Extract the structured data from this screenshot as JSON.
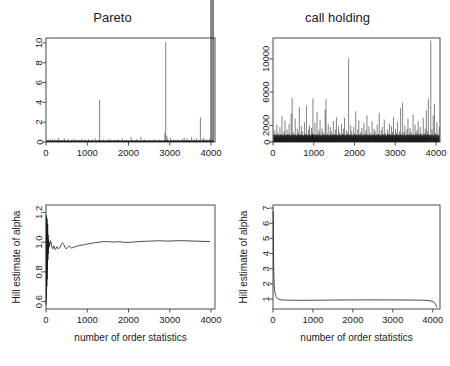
{
  "figure": {
    "layout": "2x2 grid of R base-graphics panels",
    "background": "#ffffff",
    "line_color": "#1a1a1a",
    "frame_color": "#4a4a4a"
  },
  "chart_data": [
    {
      "id": "pareto-spikes",
      "type": "bar",
      "title": "Pareto",
      "xlabel": "",
      "ylabel": "",
      "xlim": [
        0,
        4096
      ],
      "ylim": [
        0,
        10.5
      ],
      "xticks": [
        0,
        1000,
        2000,
        3000,
        4000
      ],
      "yticks": [
        0,
        2,
        4,
        6,
        8,
        10
      ],
      "xticklabels": [
        "0",
        "1000",
        "2000",
        "3000",
        "4000"
      ],
      "yticklabels": [
        "0",
        "2",
        "4",
        "6",
        "8",
        "10"
      ],
      "grid": false,
      "legend": null,
      "description": "Simulated i.i.d. Pareto(alpha=1) sample plotted as vertical spikes against index; a few extreme outliers dominate.",
      "notable_spikes": [
        {
          "x": 1300,
          "y": 4.25
        },
        {
          "x": 2990,
          "y": 10.1
        },
        {
          "x": 3830,
          "y": 2.5
        },
        {
          "x": 2960,
          "y": 0.95
        },
        {
          "x": 3020,
          "y": 0.62
        }
      ],
      "x": [
        15,
        32,
        48,
        70,
        95,
        118,
        140,
        165,
        188,
        210,
        232,
        258,
        280,
        305,
        328,
        350,
        372,
        398,
        420,
        445,
        468,
        490,
        512,
        538,
        560,
        585,
        608,
        630,
        652,
        678,
        700,
        722,
        748,
        770,
        795,
        818,
        840,
        862,
        888,
        910,
        932,
        958,
        980,
        1002,
        1028,
        1050,
        1072,
        1098,
        1120,
        1142,
        1168,
        1190,
        1212,
        1238,
        1260,
        1282,
        1300,
        1318,
        1340,
        1362,
        1388,
        1410,
        1432,
        1458,
        1480,
        1502,
        1528,
        1550,
        1572,
        1598,
        1620,
        1642,
        1668,
        1690,
        1712,
        1738,
        1760,
        1782,
        1808,
        1830,
        1852,
        1878,
        1900,
        1922,
        1948,
        1970,
        1992,
        2018,
        2040,
        2062,
        2088,
        2110,
        2132,
        2158,
        2180,
        2202,
        2228,
        2250,
        2272,
        2298,
        2320,
        2342,
        2368,
        2390,
        2412,
        2438,
        2460,
        2482,
        2508,
        2530,
        2552,
        2578,
        2600,
        2622,
        2648,
        2670,
        2692,
        2718,
        2740,
        2762,
        2788,
        2810,
        2832,
        2858,
        2880,
        2902,
        2928,
        2950,
        2960,
        2990,
        3020,
        3042,
        3068,
        3090,
        3112,
        3138,
        3160,
        3182,
        3208,
        3230,
        3252,
        3278,
        3300,
        3322,
        3348,
        3370,
        3392,
        3418,
        3440,
        3462,
        3488,
        3510,
        3532,
        3558,
        3580,
        3602,
        3628,
        3650,
        3672,
        3698,
        3720,
        3742,
        3768,
        3790,
        3812,
        3830,
        3850,
        3872,
        3898,
        3920,
        3942,
        3968,
        3990,
        4012,
        4038,
        4060
      ],
      "values": [
        0.12,
        0.05,
        0.22,
        0.08,
        0.14,
        0.31,
        0.06,
        0.18,
        0.09,
        0.27,
        0.11,
        0.07,
        0.19,
        0.42,
        0.09,
        0.15,
        0.06,
        0.23,
        0.1,
        0.35,
        0.08,
        0.17,
        0.05,
        0.29,
        0.12,
        0.07,
        0.21,
        0.09,
        0.16,
        0.33,
        0.06,
        0.14,
        0.25,
        0.08,
        0.11,
        0.19,
        0.07,
        0.3,
        0.09,
        0.13,
        0.22,
        0.06,
        0.18,
        0.1,
        0.28,
        0.08,
        0.15,
        0.05,
        0.24,
        0.12,
        0.09,
        0.37,
        0.07,
        0.16,
        0.11,
        0.2,
        4.25,
        0.08,
        0.14,
        0.06,
        0.26,
        0.1,
        0.18,
        0.07,
        0.13,
        0.23,
        0.09,
        0.31,
        0.05,
        0.17,
        0.12,
        0.08,
        0.21,
        0.06,
        0.15,
        0.28,
        0.1,
        0.19,
        0.07,
        0.13,
        0.35,
        0.09,
        0.16,
        0.06,
        0.24,
        0.11,
        0.08,
        0.18,
        0.05,
        0.47,
        0.13,
        0.09,
        0.22,
        0.07,
        0.16,
        0.3,
        0.1,
        0.14,
        0.06,
        0.52,
        0.11,
        0.08,
        0.19,
        0.25,
        0.07,
        0.13,
        0.09,
        0.17,
        0.06,
        0.21,
        0.12,
        0.08,
        0.15,
        0.28,
        0.1,
        0.06,
        0.18,
        0.11,
        0.23,
        0.07,
        0.14,
        0.09,
        0.19,
        0.12,
        0.95,
        10.1,
        0.62,
        0.33,
        0.18,
        0.09,
        0.41,
        0.14,
        0.07,
        0.22,
        0.11,
        0.16,
        0.08,
        0.26,
        0.1,
        0.13,
        0.19,
        0.06,
        0.29,
        0.12,
        0.45,
        0.08,
        0.17,
        0.36,
        0.1,
        0.21,
        0.07,
        0.14,
        0.52,
        0.09,
        0.18,
        0.26,
        0.11,
        0.38,
        0.07,
        0.15,
        0.22,
        2.5,
        0.09,
        0.31,
        0.13,
        0.43,
        0.08,
        0.19,
        0.27,
        0.11,
        0.16,
        0.34
      ]
    },
    {
      "id": "call-holding-spikes",
      "type": "bar",
      "title": "call holding",
      "xlabel": "",
      "ylabel": "",
      "xlim": [
        0,
        4096
      ],
      "ylim": [
        0,
        12500
      ],
      "xticks": [
        0,
        1000,
        2000,
        3000,
        4000
      ],
      "yticks": [
        0,
        2000,
        6000,
        10000
      ],
      "xticklabels": [
        "0",
        "1000",
        "2000",
        "3000",
        "4000"
      ],
      "yticklabels": [
        "0",
        "2000",
        "6000",
        "10000"
      ],
      "grid": false,
      "legend": null,
      "description": "Observed call holding times plotted as vertical spikes against index; heavy-tailed with many moderate spikes and two extreme peaks.",
      "notable_spikes": [
        {
          "x": 470,
          "y": 5300
        },
        {
          "x": 980,
          "y": 5250
        },
        {
          "x": 1300,
          "y": 5150
        },
        {
          "x": 1880,
          "y": 10050
        },
        {
          "x": 3210,
          "y": 4700
        },
        {
          "x": 3870,
          "y": 12200
        },
        {
          "x": 3960,
          "y": 4600
        }
      ],
      "x": [
        20,
        45,
        70,
        95,
        120,
        145,
        170,
        195,
        220,
        245,
        270,
        295,
        320,
        345,
        370,
        395,
        420,
        445,
        470,
        495,
        520,
        545,
        570,
        595,
        620,
        645,
        670,
        695,
        720,
        745,
        770,
        795,
        820,
        845,
        870,
        895,
        920,
        945,
        970,
        980,
        1005,
        1030,
        1055,
        1080,
        1105,
        1130,
        1155,
        1180,
        1205,
        1230,
        1255,
        1280,
        1300,
        1330,
        1355,
        1380,
        1405,
        1430,
        1455,
        1480,
        1505,
        1530,
        1555,
        1580,
        1605,
        1630,
        1655,
        1680,
        1705,
        1730,
        1755,
        1780,
        1805,
        1830,
        1855,
        1880,
        1905,
        1930,
        1955,
        1980,
        2005,
        2030,
        2055,
        2080,
        2105,
        2130,
        2155,
        2180,
        2205,
        2230,
        2255,
        2280,
        2305,
        2330,
        2355,
        2380,
        2405,
        2430,
        2455,
        2480,
        2505,
        2530,
        2555,
        2580,
        2605,
        2630,
        2655,
        2680,
        2705,
        2730,
        2755,
        2780,
        2805,
        2830,
        2855,
        2880,
        2905,
        2930,
        2955,
        2980,
        3005,
        3030,
        3055,
        3080,
        3105,
        3130,
        3155,
        3180,
        3210,
        3235,
        3260,
        3285,
        3310,
        3335,
        3360,
        3385,
        3410,
        3435,
        3460,
        3485,
        3510,
        3535,
        3560,
        3585,
        3610,
        3635,
        3660,
        3685,
        3710,
        3735,
        3760,
        3785,
        3810,
        3840,
        3870,
        3900,
        3930,
        3960,
        3990,
        4020,
        4050,
        4075
      ],
      "values": [
        900,
        1400,
        700,
        2100,
        1100,
        600,
        1800,
        950,
        3100,
        750,
        1300,
        2600,
        800,
        1500,
        1000,
        2200,
        650,
        3400,
        5300,
        1200,
        900,
        2800,
        700,
        1600,
        1100,
        4200,
        850,
        1900,
        1300,
        700,
        2400,
        1000,
        4350,
        800,
        1500,
        2000,
        650,
        1700,
        1100,
        5250,
        900,
        2300,
        750,
        3600,
        1050,
        1400,
        2700,
        800,
        1600,
        1200,
        900,
        3900,
        5150,
        1000,
        2100,
        700,
        1800,
        1300,
        850,
        2500,
        950,
        1500,
        3000,
        700,
        1900,
        1150,
        800,
        2200,
        1000,
        1600,
        2900,
        750,
        1400,
        1100,
        10050,
        900,
        2000,
        1300,
        700,
        1800,
        1050,
        3700,
        850,
        1500,
        2600,
        900,
        1200,
        1700,
        750,
        2300,
        1000,
        1400,
        3200,
        800,
        1900,
        1100,
        650,
        2500,
        950,
        1600,
        1300,
        800,
        2100,
        1000,
        3500,
        750,
        1400,
        1800,
        900,
        2700,
        1100,
        700,
        1500,
        1050,
        2200,
        850,
        1900,
        1200,
        3000,
        750,
        1600,
        1100,
        2400,
        900,
        1300,
        4100,
        950,
        4700,
        1200,
        2000,
        800,
        1500,
        2800,
        1000,
        1700,
        1250,
        900,
        3300,
        800,
        2100,
        1150,
        1400,
        2500,
        950,
        1800,
        1100,
        700,
        2900,
        1050,
        1600,
        3800,
        1300,
        5200,
        900,
        12200,
        1500,
        3200,
        4600,
        1100,
        2400,
        900,
        1800
      ]
    },
    {
      "id": "hill-plot-pareto",
      "type": "line",
      "title": "",
      "xlabel": "number of order statistics",
      "ylabel": "Hill estimate of alpha",
      "xlim": [
        0,
        4096
      ],
      "ylim": [
        0.55,
        1.25
      ],
      "xticks": [
        0,
        1000,
        2000,
        3000,
        4000
      ],
      "yticks": [
        0.6,
        0.8,
        1.0,
        1.2
      ],
      "xticklabels": [
        "0",
        "1000",
        "2000",
        "3000",
        "4000"
      ],
      "yticklabels": [
        "0.6",
        "0.8",
        "1.0",
        "1.2"
      ],
      "grid": false,
      "legend": null,
      "description": "Hill plot for the Pareto sample: violent oscillation at small k, rapidly stabilising near the true value alpha = 1.",
      "x": [
        5,
        8,
        12,
        16,
        20,
        24,
        28,
        32,
        36,
        40,
        45,
        50,
        55,
        60,
        66,
        72,
        78,
        85,
        92,
        100,
        110,
        120,
        132,
        145,
        158,
        172,
        188,
        205,
        222,
        240,
        260,
        280,
        300,
        325,
        350,
        375,
        400,
        430,
        460,
        490,
        520,
        555,
        590,
        625,
        660,
        700,
        740,
        780,
        820,
        865,
        910,
        955,
        1000,
        1050,
        1100,
        1150,
        1200,
        1260,
        1320,
        1380,
        1440,
        1500,
        1570,
        1640,
        1710,
        1780,
        1850,
        1930,
        2010,
        2090,
        2170,
        2260,
        2350,
        2440,
        2530,
        2630,
        2730,
        2830,
        2930,
        3040,
        3150,
        3260,
        3370,
        3490,
        3610,
        3730,
        3850,
        3970,
        4050
      ],
      "values": [
        0.58,
        1.18,
        0.62,
        1.14,
        0.7,
        1.16,
        0.75,
        1.1,
        0.82,
        1.12,
        0.88,
        1.05,
        0.92,
        1.02,
        0.96,
        1.0,
        0.97,
        0.99,
        0.985,
        0.99,
        1.01,
        1.0,
        0.975,
        0.965,
        0.955,
        0.96,
        0.975,
        0.965,
        0.95,
        0.955,
        0.97,
        0.965,
        0.955,
        0.96,
        0.97,
        0.985,
        0.995,
        0.985,
        0.965,
        0.955,
        0.965,
        0.975,
        0.965,
        0.96,
        0.965,
        0.968,
        0.972,
        0.975,
        0.978,
        0.98,
        0.982,
        0.985,
        0.987,
        0.99,
        0.992,
        0.995,
        0.997,
        0.999,
        1.001,
        1.003,
        1.004,
        1.003,
        1.002,
        1.001,
        1.002,
        1.003,
        1.0,
        0.998,
        0.999,
        1.0,
        1.002,
        1.004,
        1.005,
        1.006,
        1.007,
        1.008,
        1.009,
        1.008,
        1.007,
        1.008,
        1.009,
        1.01,
        1.009,
        1.008,
        1.007,
        1.006,
        1.005,
        1.004
      ]
    },
    {
      "id": "hill-plot-call-holding",
      "type": "line",
      "title": "",
      "xlabel": "number of order statistics",
      "ylabel": "Hill estimate of alpha",
      "xlim": [
        0,
        4180
      ],
      "ylim": [
        0.35,
        7.2
      ],
      "xticks": [
        0,
        1000,
        2000,
        3000,
        4000
      ],
      "yticks": [
        1,
        2,
        3,
        4,
        5,
        6,
        7
      ],
      "xticklabels": [
        "0",
        "1000",
        "2000",
        "3000",
        "4000"
      ],
      "yticklabels": [
        "1",
        "2",
        "3",
        "4",
        "5",
        "6",
        "7"
      ],
      "grid": false,
      "legend": null,
      "description": "Hill plot for the call holding data: steep decay from about 6.8 at very small k to a long flat plateau slightly below 1, dipping at the largest k.",
      "x": [
        4,
        6,
        8,
        10,
        13,
        16,
        20,
        25,
        30,
        36,
        43,
        50,
        58,
        67,
        77,
        88,
        100,
        115,
        132,
        150,
        170,
        195,
        220,
        250,
        285,
        320,
        360,
        405,
        455,
        510,
        570,
        635,
        705,
        780,
        860,
        945,
        1035,
        1130,
        1230,
        1335,
        1445,
        1560,
        1680,
        1805,
        1935,
        2070,
        2210,
        2355,
        2505,
        2660,
        2820,
        2985,
        3155,
        3330,
        3510,
        3695,
        3830,
        3900,
        3955,
        4000,
        4035,
        4060,
        4080,
        4095
      ],
      "values": [
        6.8,
        6.4,
        5.7,
        4.9,
        4.1,
        3.4,
        2.8,
        2.3,
        1.95,
        1.7,
        1.52,
        1.4,
        1.3,
        1.22,
        1.16,
        1.11,
        1.07,
        1.04,
        1.01,
        0.99,
        0.975,
        0.962,
        0.953,
        0.946,
        0.94,
        0.936,
        0.933,
        0.93,
        0.928,
        0.927,
        0.926,
        0.925,
        0.925,
        0.925,
        0.926,
        0.927,
        0.928,
        0.93,
        0.932,
        0.934,
        0.936,
        0.939,
        0.942,
        0.945,
        0.947,
        0.949,
        0.95,
        0.951,
        0.951,
        0.95,
        0.949,
        0.947,
        0.945,
        0.942,
        0.938,
        0.932,
        0.92,
        0.905,
        0.88,
        0.84,
        0.78,
        0.7,
        0.6,
        0.47
      ]
    }
  ]
}
